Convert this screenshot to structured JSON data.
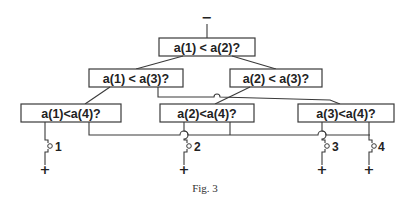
{
  "figure": {
    "caption": "Fig. 3",
    "input_sign": "−",
    "nodes": {
      "root": {
        "label": "a(1) < a(2)?"
      },
      "l2_left": {
        "label": "a(1) < a(3)?"
      },
      "l2_right": {
        "label": "a(2) < a(3)?"
      },
      "l3_a": {
        "label": "a(1)<a(4)?"
      },
      "l3_b": {
        "label": "a(2)<a(4)?"
      },
      "l3_c": {
        "label": "a(3)<a(4)?"
      }
    },
    "outputs": [
      {
        "label": "1",
        "sign": "+"
      },
      {
        "label": "2",
        "sign": "+"
      },
      {
        "label": "3",
        "sign": "+"
      },
      {
        "label": "4",
        "sign": "+"
      }
    ]
  }
}
